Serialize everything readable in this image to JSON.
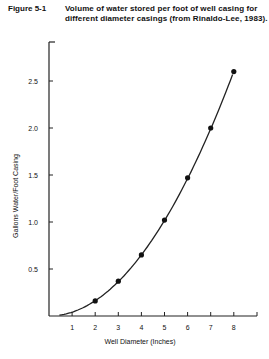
{
  "figure": {
    "label": "Figure 5-1",
    "caption": "Volume of water stored per foot of well casing for different diameter casings (from Rinaldo-Lee, 1983)."
  },
  "chart_data": {
    "type": "line",
    "title": "Volume of water stored per foot of well casing for different diameter casings (from Rinaldo-Lee, 1983).",
    "xlabel": "Well Diameter (Inches)",
    "ylabel": "Gallons Water/Foot Casing",
    "xlim": [
      0,
      9
    ],
    "ylim": [
      0,
      3.0
    ],
    "xticks": [
      1,
      2,
      3,
      4,
      5,
      6,
      7,
      8
    ],
    "xtick_labels": [
      "1",
      "2",
      "3",
      "4",
      "5",
      "6",
      "7",
      "8"
    ],
    "yticks": [
      0.5,
      1.0,
      1.5,
      2.0,
      2.5
    ],
    "ytick_labels": [
      "0.5",
      "1.0",
      "1.5",
      "2.0",
      "2.5"
    ],
    "grid": false,
    "series": [
      {
        "name": "Gallons per foot",
        "x": [
          2,
          3,
          4,
          5,
          6,
          7,
          8
        ],
        "y": [
          0.16,
          0.37,
          0.65,
          1.02,
          1.47,
          2.0,
          2.6
        ],
        "markers": true,
        "curve": "smooth"
      }
    ]
  }
}
